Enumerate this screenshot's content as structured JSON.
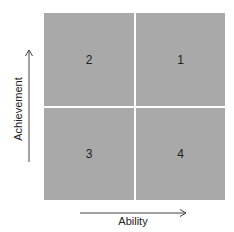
{
  "diagram": {
    "quadrants": {
      "top_left": "2",
      "top_right": "1",
      "bottom_left": "3",
      "bottom_right": "4"
    },
    "y_axis_label": "Achievement",
    "x_axis_label": "Ability",
    "colors": {
      "quadrant_fill": "#a9a9a9",
      "divider": "#ffffff",
      "arrow": "#444444"
    }
  }
}
